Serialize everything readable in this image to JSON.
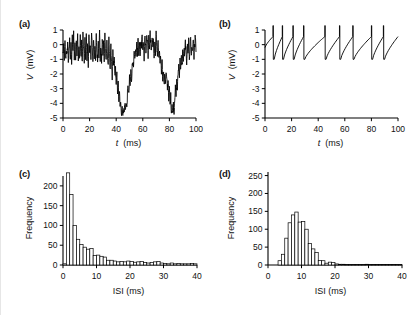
{
  "figure": {
    "background": "#ffffff",
    "line_color": "#000000",
    "panels": [
      "(a)",
      "(b)",
      "(c)",
      "(d)"
    ]
  },
  "chart_data": [
    {
      "panel": "(a)",
      "type": "line",
      "title": "",
      "xlabel": "t (ms)",
      "ylabel": "V (mV)",
      "xlim": [
        0,
        100
      ],
      "ylim": [
        -5,
        1
      ],
      "xticks": [
        0,
        20,
        40,
        60,
        80,
        100
      ],
      "yticks": [
        1,
        0,
        -1,
        -2,
        -3,
        -4,
        -5
      ],
      "grid": false,
      "legend": "none",
      "description": "Noisy sub-threshold membrane potential trace with two deep hyperpolarizing excursions near t = 40 ms and t = 80 ms",
      "x": [
        0,
        0.5,
        1,
        1.5,
        2,
        2.5,
        3,
        3.5,
        4,
        4.5,
        5,
        5.5,
        6,
        6.5,
        7,
        7.5,
        8,
        8.5,
        9,
        9.5,
        10,
        10.5,
        11,
        11.5,
        12,
        12.5,
        13,
        13.5,
        14,
        14.5,
        15,
        15.5,
        16,
        16.5,
        17,
        17.5,
        18,
        18.5,
        19,
        19.5,
        20,
        20.5,
        21,
        21.5,
        22,
        22.5,
        23,
        23.5,
        24,
        24.5,
        25,
        25.5,
        26,
        26.5,
        27,
        27.5,
        28,
        28.5,
        29,
        29.5,
        30,
        30.5,
        31,
        31.5,
        32,
        32.5,
        33,
        33.5,
        34,
        34.5,
        35,
        35.5,
        36,
        36.5,
        37,
        37.5,
        38,
        38.5,
        39,
        39.5,
        40,
        40.5,
        41,
        41.5,
        42,
        42.5,
        43,
        43.5,
        44,
        44.5,
        45,
        45.5,
        46,
        46.5,
        47,
        47.5,
        48,
        48.5,
        49,
        49.5,
        50,
        50.5,
        51,
        51.5,
        52,
        52.5,
        53,
        53.5,
        54,
        54.5,
        55,
        55.5,
        56,
        56.5,
        57,
        57.5,
        58,
        58.5,
        59,
        59.5,
        60,
        60.5,
        61,
        61.5,
        62,
        62.5,
        63,
        63.5,
        64,
        64.5,
        65,
        65.5,
        66,
        66.5,
        67,
        67.5,
        68,
        68.5,
        69,
        69.5,
        70,
        70.5,
        71,
        71.5,
        72,
        72.5,
        73,
        73.5,
        74,
        74.5,
        75,
        75.5,
        76,
        76.5,
        77,
        77.5,
        78,
        78.5,
        79,
        79.5,
        80,
        80.5,
        81,
        81.5,
        82,
        82.5,
        83,
        83.5,
        84,
        84.5,
        85,
        85.5,
        86,
        86.5,
        87,
        87.5,
        88,
        88.5,
        89,
        89.5,
        90,
        90.5,
        91,
        91.5,
        92,
        92.5,
        93,
        93.5,
        94,
        94.5,
        95,
        95.5,
        96,
        96.5,
        97,
        97.5,
        98,
        98.5,
        99,
        99.5,
        100
      ],
      "y": [
        -0.6,
        -0.2,
        -0.9,
        0.1,
        -1.0,
        -0.3,
        -0.8,
        0.2,
        -1.1,
        -0.4,
        0.3,
        -0.9,
        -0.1,
        -1.2,
        0.5,
        -0.6,
        0.9,
        -1.0,
        0.2,
        -1.3,
        0.4,
        -0.5,
        0.8,
        -1.1,
        -0.2,
        -0.9,
        0.6,
        -1.0,
        0.1,
        -1.2,
        0.7,
        -0.4,
        -1.1,
        0.3,
        -0.8,
        0.9,
        -1.0,
        -0.1,
        -1.3,
        0.5,
        -0.6,
        0.2,
        -1.1,
        0.8,
        -0.3,
        -1.0,
        0.4,
        -0.9,
        0.1,
        -1.2,
        0.6,
        -0.5,
        -1.1,
        0.3,
        -0.7,
        0.9,
        -1.0,
        -0.2,
        -1.2,
        0.5,
        -0.6,
        0.1,
        -1.3,
        0.7,
        -0.4,
        -1.0,
        0.2,
        -0.9,
        -1.4,
        0.3,
        -0.8,
        -1.6,
        -0.2,
        -1.1,
        -2.3,
        -0.6,
        -1.5,
        -1.0,
        -2.0,
        -1.6,
        -2.6,
        -2.1,
        -3.2,
        -2.7,
        -3.8,
        -3.3,
        -4.4,
        -3.9,
        -4.7,
        -4.2,
        -4.9,
        -4.3,
        -4.6,
        -4.0,
        -4.5,
        -3.9,
        -4.4,
        -3.3,
        -2.8,
        -3.5,
        -2.3,
        -2.9,
        -1.8,
        -2.4,
        -1.5,
        -1.0,
        -1.7,
        -0.6,
        -1.2,
        -0.3,
        -0.9,
        0.2,
        -0.6,
        0.5,
        -1.0,
        -0.1,
        -0.7,
        0.4,
        -0.2,
        0.8,
        -0.4,
        0.3,
        -0.9,
        0.6,
        0.0,
        -0.5,
        0.9,
        0.2,
        -0.8,
        0.5,
        -0.2,
        1.0,
        0.1,
        -0.6,
        0.7,
        -0.3,
        0.4,
        -1.0,
        0.2,
        -0.5,
        0.8,
        -0.1,
        -0.7,
        0.3,
        -1.1,
        -0.4,
        -1.5,
        -0.8,
        -1.9,
        -1.2,
        -2.3,
        -1.6,
        -2.8,
        -2.0,
        -2.5,
        -1.9,
        -2.4,
        -3.0,
        -2.5,
        -3.6,
        -3.0,
        -4.2,
        -3.5,
        -4.6,
        -4.0,
        -4.8,
        -4.1,
        -4.5,
        -3.6,
        -3.0,
        -3.5,
        -2.5,
        -3.0,
        -2.0,
        -1.4,
        -2.0,
        -1.1,
        -1.7,
        -0.8,
        -1.4,
        -0.5,
        -1.1,
        -0.2,
        -0.9,
        0.2,
        -0.6,
        -1.2,
        0.1,
        -0.7,
        0.4,
        -1.0,
        -0.3,
        0.6,
        -0.9,
        0.0,
        -0.6,
        0.5,
        -1.0,
        -0.2,
        0.7,
        -0.5,
        0.3,
        -0.8,
        0.1,
        -0.4,
        0.6
      ]
    },
    {
      "panel": "(b)",
      "type": "line",
      "title": "",
      "xlabel": "t (ms)",
      "ylabel": "V (mV)",
      "xlim": [
        0,
        100
      ],
      "ylim": [
        -5,
        1
      ],
      "xticks": [
        0,
        20,
        40,
        60,
        80,
        100
      ],
      "yticks": [
        1,
        0,
        -1,
        -2,
        -3,
        -4,
        -5
      ],
      "grid": false,
      "legend": "none",
      "description": "Regular integrate-and-fire spike train: ramping depolarization to threshold followed by reset, about 10 spikes over 100 ms",
      "spike_times": [
        6,
        13,
        21,
        29,
        45,
        56,
        66,
        80,
        89
      ],
      "spike_peak": 1.3,
      "reset_value": -1.0,
      "baseline_start": -0.2
    },
    {
      "panel": "(c)",
      "type": "bar",
      "title": "",
      "xlabel": "ISI (ms)",
      "ylabel": "Frequency",
      "xlim": [
        0,
        40
      ],
      "ylim": [
        0,
        225
      ],
      "xticks": [
        0,
        10,
        20,
        30,
        40
      ],
      "yticks": [
        0,
        50,
        100,
        150,
        200
      ],
      "grid": false,
      "legend": "none",
      "bin_width": 1,
      "description": "Exponentially decaying interspike-interval histogram (Poisson-like firing)",
      "categories": [
        1,
        2,
        3,
        4,
        5,
        6,
        7,
        8,
        9,
        10,
        11,
        12,
        13,
        14,
        15,
        16,
        17,
        18,
        19,
        20,
        21,
        22,
        23,
        24,
        25,
        26,
        27,
        28,
        29,
        30,
        31,
        32,
        33,
        34,
        35,
        36,
        37,
        38,
        39,
        40
      ],
      "values": [
        3,
        233,
        178,
        100,
        65,
        52,
        45,
        40,
        42,
        24,
        25,
        22,
        20,
        12,
        12,
        10,
        8,
        9,
        8,
        10,
        9,
        7,
        8,
        9,
        6,
        5,
        6,
        8,
        9,
        5,
        4,
        3,
        5,
        3,
        4,
        3,
        3,
        3,
        4,
        3
      ]
    },
    {
      "panel": "(d)",
      "type": "bar",
      "title": "",
      "xlabel": "ISI (ms)",
      "ylabel": "Frequency",
      "xlim": [
        0,
        40
      ],
      "ylim": [
        0,
        260
      ],
      "xticks": [
        0,
        10,
        20,
        30,
        40
      ],
      "yticks": [
        0,
        50,
        100,
        150,
        200,
        250
      ],
      "grid": false,
      "legend": "none",
      "bin_width": 1,
      "description": "Unimodal interspike-interval histogram peaking near 9 ms (regular firing)",
      "categories": [
        1,
        2,
        3,
        4,
        5,
        6,
        7,
        8,
        9,
        10,
        11,
        12,
        13,
        14,
        15,
        16,
        17,
        18,
        19,
        20,
        21,
        22,
        23,
        24,
        25,
        26,
        27,
        28,
        29,
        30,
        31,
        32,
        33,
        34,
        35,
        36,
        37,
        38,
        39,
        40
      ],
      "values": [
        0,
        0,
        0,
        12,
        30,
        75,
        118,
        140,
        148,
        120,
        122,
        100,
        60,
        45,
        35,
        13,
        12,
        5,
        8,
        7,
        3,
        2,
        2,
        1,
        1,
        1,
        1,
        1,
        1,
        2,
        1,
        1,
        1,
        1,
        1,
        1,
        1,
        1,
        1,
        1
      ]
    }
  ]
}
